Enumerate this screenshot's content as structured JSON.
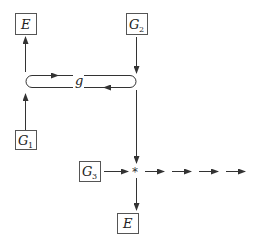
{
  "diagram": {
    "nodes": {
      "E_top": {
        "label": "E",
        "sub": ""
      },
      "G2": {
        "label": "G",
        "sub": "2"
      },
      "G1": {
        "label": "G",
        "sub": "1"
      },
      "G3": {
        "label": "G",
        "sub": "3"
      },
      "E_bottom": {
        "label": "E",
        "sub": ""
      }
    },
    "loop_label": "g",
    "junction_symbol": "*",
    "colors": {
      "stroke": "#333333",
      "box_border": "#555555",
      "background": "#ffffff"
    }
  }
}
